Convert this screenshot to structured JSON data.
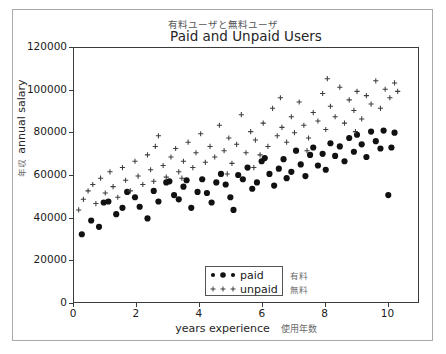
{
  "figure": {
    "caption_jp": "有料ユーザと無料ユーザ",
    "title": "Paid and Unpaid Users"
  },
  "axes": {
    "xlabel": "years experience",
    "xlabel_jp": "使用年数",
    "ylabel": "annual salary",
    "ylabel_jp": "年収",
    "xticks": [
      0,
      2,
      4,
      6,
      8,
      10
    ],
    "yticks": [
      0,
      20000,
      40000,
      60000,
      80000,
      100000,
      120000
    ],
    "xlim": [
      0,
      11
    ],
    "ylim": [
      0,
      120000
    ],
    "grid": false
  },
  "legend": {
    "position": "lower center",
    "entries": [
      {
        "label": "paid",
        "marker": "filled-circle",
        "jp": "有料",
        "color": "#1a1a1a"
      },
      {
        "label": "unpaid",
        "marker": "plus",
        "jp": "無料",
        "color": "#4d4d4d"
      }
    ]
  },
  "chart_data": {
    "type": "scatter",
    "title": "Paid and Unpaid Users",
    "xlabel": "years experience",
    "ylabel": "annual salary",
    "xlim": [
      0,
      11
    ],
    "ylim": [
      0,
      120000
    ],
    "grid": false,
    "series": [
      {
        "name": "paid",
        "marker": "filled-circle",
        "color": "#111111",
        "points": [
          [
            0.25,
            32000
          ],
          [
            0.55,
            38500
          ],
          [
            0.8,
            35500
          ],
          [
            0.95,
            47000
          ],
          [
            1.1,
            47500
          ],
          [
            1.35,
            41500
          ],
          [
            1.55,
            44500
          ],
          [
            1.7,
            52000
          ],
          [
            1.95,
            49500
          ],
          [
            2.1,
            45000
          ],
          [
            2.35,
            39500
          ],
          [
            2.55,
            52500
          ],
          [
            2.7,
            47500
          ],
          [
            2.95,
            56500
          ],
          [
            3.05,
            57000
          ],
          [
            3.2,
            50500
          ],
          [
            3.35,
            48500
          ],
          [
            3.5,
            54500
          ],
          [
            3.6,
            57500
          ],
          [
            3.75,
            44500
          ],
          [
            3.95,
            52000
          ],
          [
            4.1,
            58000
          ],
          [
            4.25,
            51500
          ],
          [
            4.4,
            47000
          ],
          [
            4.55,
            56500
          ],
          [
            4.7,
            60500
          ],
          [
            4.85,
            55500
          ],
          [
            5.0,
            49500
          ],
          [
            5.1,
            43500
          ],
          [
            5.25,
            60000
          ],
          [
            5.4,
            58000
          ],
          [
            5.55,
            63500
          ],
          [
            5.7,
            53500
          ],
          [
            5.85,
            56500
          ],
          [
            6.0,
            66500
          ],
          [
            6.1,
            68000
          ],
          [
            6.25,
            60500
          ],
          [
            6.4,
            55000
          ],
          [
            6.55,
            63000
          ],
          [
            6.7,
            67500
          ],
          [
            6.8,
            58500
          ],
          [
            6.95,
            61500
          ],
          [
            7.1,
            71500
          ],
          [
            7.25,
            65000
          ],
          [
            7.4,
            59500
          ],
          [
            7.55,
            69500
          ],
          [
            7.65,
            73000
          ],
          [
            7.8,
            64500
          ],
          [
            7.95,
            70000
          ],
          [
            8.05,
            62500
          ],
          [
            8.2,
            75000
          ],
          [
            8.35,
            69000
          ],
          [
            8.5,
            73500
          ],
          [
            8.65,
            66500
          ],
          [
            8.8,
            77500
          ],
          [
            8.95,
            71000
          ],
          [
            9.05,
            79000
          ],
          [
            9.2,
            74500
          ],
          [
            9.35,
            68500
          ],
          [
            9.5,
            80500
          ],
          [
            9.65,
            76000
          ],
          [
            9.8,
            72500
          ],
          [
            9.9,
            81000
          ],
          [
            10.05,
            50500
          ],
          [
            10.15,
            73000
          ],
          [
            10.25,
            80000
          ]
        ]
      },
      {
        "name": "unpaid",
        "marker": "plus",
        "color": "#3d3d3d",
        "points": [
          [
            0.15,
            43500
          ],
          [
            0.3,
            48500
          ],
          [
            0.45,
            52500
          ],
          [
            0.6,
            55500
          ],
          [
            0.7,
            46500
          ],
          [
            0.85,
            58500
          ],
          [
            1.0,
            51500
          ],
          [
            1.15,
            61500
          ],
          [
            1.25,
            54500
          ],
          [
            1.4,
            49500
          ],
          [
            1.55,
            63500
          ],
          [
            1.65,
            57500
          ],
          [
            1.8,
            52500
          ],
          [
            1.95,
            66500
          ],
          [
            2.05,
            59500
          ],
          [
            2.2,
            55500
          ],
          [
            2.35,
            69500
          ],
          [
            2.45,
            62500
          ],
          [
            2.55,
            57000
          ],
          [
            2.7,
            78500
          ],
          [
            2.85,
            64500
          ],
          [
            2.95,
            59000
          ],
          [
            3.1,
            68500
          ],
          [
            3.25,
            72500
          ],
          [
            3.35,
            61500
          ],
          [
            3.5,
            66500
          ],
          [
            3.65,
            75500
          ],
          [
            3.8,
            63500
          ],
          [
            3.9,
            70500
          ],
          [
            4.05,
            79500
          ],
          [
            4.2,
            66000
          ],
          [
            4.35,
            73500
          ],
          [
            4.5,
            68500
          ],
          [
            4.65,
            83500
          ],
          [
            4.8,
            71500
          ],
          [
            4.95,
            77500
          ],
          [
            5.05,
            65500
          ],
          [
            5.2,
            74500
          ],
          [
            5.35,
            88500
          ],
          [
            5.5,
            70500
          ],
          [
            5.65,
            80500
          ],
          [
            5.8,
            76500
          ],
          [
            5.95,
            69500
          ],
          [
            6.05,
            84500
          ],
          [
            6.2,
            73500
          ],
          [
            6.35,
            91500
          ],
          [
            6.5,
            78500
          ],
          [
            6.65,
            82500
          ],
          [
            6.8,
            75500
          ],
          [
            6.95,
            87500
          ],
          [
            7.05,
            80000
          ],
          [
            7.2,
            94500
          ],
          [
            7.35,
            83500
          ],
          [
            7.5,
            77500
          ],
          [
            7.65,
            89500
          ],
          [
            7.8,
            85500
          ],
          [
            7.95,
            98500
          ],
          [
            8.05,
            81500
          ],
          [
            8.2,
            92500
          ],
          [
            8.35,
            87500
          ],
          [
            8.5,
            101500
          ],
          [
            8.65,
            84500
          ],
          [
            8.8,
            95500
          ],
          [
            8.95,
            90500
          ],
          [
            9.05,
            99500
          ],
          [
            9.2,
            86500
          ],
          [
            9.35,
            97500
          ],
          [
            9.5,
            93500
          ],
          [
            9.65,
            104500
          ],
          [
            9.8,
            91500
          ],
          [
            9.95,
            100500
          ],
          [
            10.1,
            96500
          ],
          [
            10.25,
            103500
          ],
          [
            10.35,
            99500
          ],
          [
            2.6,
            73500
          ],
          [
            3.45,
            58500
          ],
          [
            4.9,
            60500
          ],
          [
            5.75,
            63500
          ],
          [
            6.6,
            96500
          ],
          [
            7.45,
            71500
          ],
          [
            8.1,
            105500
          ],
          [
            9.0,
            80500
          ]
        ]
      }
    ]
  }
}
